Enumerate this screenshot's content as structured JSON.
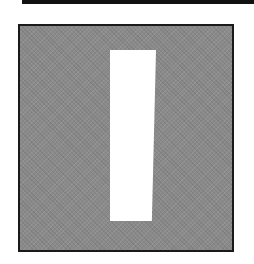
{
  "image": {
    "description": "Gray halftone square with a slightly slanted white vertical bar",
    "colors": {
      "background": "#ffffff",
      "frame_fill": "#8a8a8a",
      "frame_border": "#1a1a1a",
      "bar": "#ffffff",
      "topbar": "#111111"
    },
    "bar": {
      "left": 90,
      "top": 24,
      "width": 46,
      "height": 171
    }
  }
}
